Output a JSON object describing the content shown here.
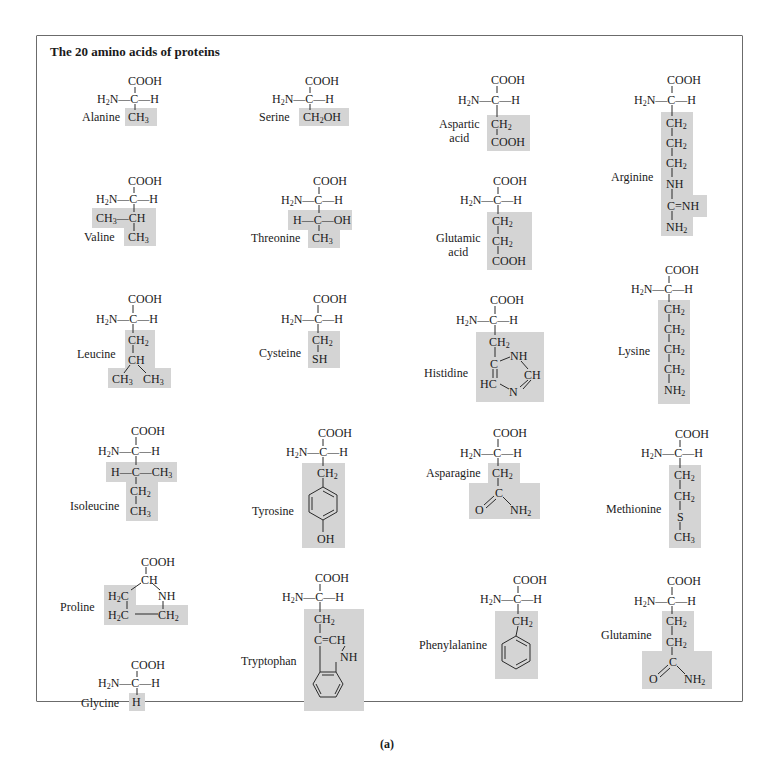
{
  "figure": {
    "title": "The 20 amino acids of proteins",
    "caption": "(a)",
    "shade_color": "#d4d4d4",
    "border_color": "#6b6b6b"
  },
  "backbone": {
    "carboxyl": "COOH",
    "amino": "H",
    "amino_sub": "2",
    "amino_n": "N",
    "alpha_c": "C",
    "h": "H"
  },
  "amino_acids": [
    {
      "id": "alanine",
      "name": "Alanine",
      "side_chain": [
        "CH3"
      ]
    },
    {
      "id": "serine",
      "name": "Serine",
      "side_chain": [
        "CH2OH"
      ]
    },
    {
      "id": "aspartic-acid",
      "name": "Aspartic acid",
      "name_lines": [
        "Aspartic",
        "acid"
      ],
      "side_chain": [
        "CH2",
        "COOH"
      ]
    },
    {
      "id": "arginine",
      "name": "Arginine",
      "side_chain": [
        "CH2",
        "CH2",
        "CH2",
        "NH",
        "C=NH",
        "NH2"
      ]
    },
    {
      "id": "valine",
      "name": "Valine",
      "side_chain": [
        "CH3—CH",
        "CH3"
      ]
    },
    {
      "id": "threonine",
      "name": "Threonine",
      "side_chain": [
        "H—C—OH",
        "CH3"
      ]
    },
    {
      "id": "glutamic-acid",
      "name": "Glutamic acid",
      "name_lines": [
        "Glutamic",
        "acid"
      ],
      "side_chain": [
        "CH2",
        "CH2",
        "COOH"
      ]
    },
    {
      "id": "lysine",
      "name": "Lysine",
      "side_chain": [
        "CH2",
        "CH2",
        "CH2",
        "CH2",
        "NH2"
      ]
    },
    {
      "id": "leucine",
      "name": "Leucine",
      "side_chain": [
        "CH2",
        "CH",
        "CH3",
        "CH3"
      ]
    },
    {
      "id": "cysteine",
      "name": "Cysteine",
      "side_chain": [
        "CH2",
        "SH"
      ]
    },
    {
      "id": "histidine",
      "name": "Histidine",
      "side_chain": [
        "CH2",
        "C",
        "NH",
        "CH",
        "HC",
        "N"
      ]
    },
    {
      "id": "isoleucine",
      "name": "Isoleucine",
      "side_chain": [
        "H—C—CH3",
        "CH2",
        "CH3"
      ]
    },
    {
      "id": "tyrosine",
      "name": "Tyrosine",
      "side_chain": [
        "CH2",
        "benzene-ring",
        "OH"
      ]
    },
    {
      "id": "asparagine",
      "name": "Asparagine",
      "side_chain": [
        "CH2",
        "C",
        "O",
        "NH2"
      ]
    },
    {
      "id": "methionine",
      "name": "Methionine",
      "side_chain": [
        "CH2",
        "CH2",
        "S",
        "CH3"
      ]
    },
    {
      "id": "proline",
      "name": "Proline",
      "side_chain": [
        "CH",
        "H2C",
        "NH",
        "H2C",
        "CH2"
      ],
      "carboxyl": "COOH"
    },
    {
      "id": "tryptophan",
      "name": "Tryptophan",
      "side_chain": [
        "CH2",
        "C=CH",
        "NH",
        "benzene-ring"
      ]
    },
    {
      "id": "phenylalanine",
      "name": "Phenylalanine",
      "side_chain": [
        "CH2",
        "benzene-ring"
      ]
    },
    {
      "id": "glutamine",
      "name": "Glutamine",
      "side_chain": [
        "CH2",
        "CH2",
        "C",
        "O",
        "NH2"
      ]
    },
    {
      "id": "glycine",
      "name": "Glycine",
      "side_chain": [
        "H"
      ]
    }
  ],
  "labels": {
    "alanine": "Alanine",
    "serine": "Serine",
    "aspartic_1": "Aspartic",
    "aspartic_2": "acid",
    "arginine": "Arginine",
    "valine": "Valine",
    "threonine": "Threonine",
    "glutamic_1": "Glutamic",
    "glutamic_2": "acid",
    "lysine": "Lysine",
    "leucine": "Leucine",
    "cysteine": "Cysteine",
    "histidine": "Histidine",
    "isoleucine": "Isoleucine",
    "tyrosine": "Tyrosine",
    "asparagine": "Asparagine",
    "methionine": "Methionine",
    "proline": "Proline",
    "tryptophan": "Tryptophan",
    "phenylalanine": "Phenylalanine",
    "glutamine": "Glutamine",
    "glycine": "Glycine"
  },
  "groups": {
    "cooh": "COOH",
    "ch": "CH",
    "c": "C",
    "h": "H",
    "nh": "NH",
    "n": "N",
    "s": "S",
    "sh": "SH",
    "oh": "OH",
    "o": "O",
    "hc": "HC",
    "ch_eq": "C=CH",
    "c_eq_nh": "C=NH",
    "ch3": "CH",
    "ch3_sub": "3",
    "ch2": "CH",
    "ch2_sub": "2",
    "nh2": "NH",
    "nh2_sub": "2",
    "h2c": "H",
    "h2c_sub": "2",
    "h2c_c": "C",
    "ch2oh_a": "CH",
    "ch2oh_sub": "2",
    "ch2oh_b": "OH",
    "h_c_oh": "H—C—OH",
    "h_c_ch3_a": "H—C—CH",
    "ch3_ch": "—CH"
  }
}
